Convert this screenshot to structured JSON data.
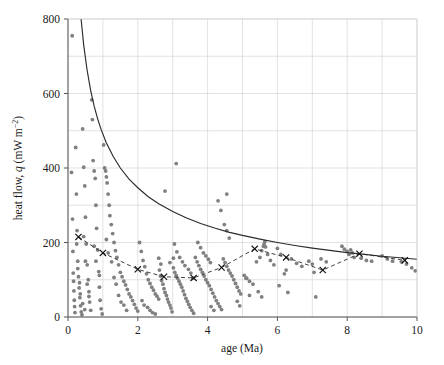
{
  "chart_data": {
    "type": "scatter",
    "title": "",
    "xlabel": "age (Ma)",
    "ylabel_main": "heat flow, ",
    "ylabel_italic": "q",
    "ylabel_units": " (mW m",
    "ylabel_exp": "−2",
    "ylabel_close": ")",
    "ylabel_full": "heat flow, q (mW m−2)",
    "xlim": [
      0,
      10
    ],
    "ylim": [
      0,
      800
    ],
    "xticks": [
      0,
      2,
      4,
      6,
      8,
      10
    ],
    "xtick_labels": [
      "0",
      "2",
      "4",
      "6",
      "8",
      "10"
    ],
    "yticks": [
      0,
      200,
      400,
      600,
      800
    ],
    "ytick_labels": [
      "0",
      "200",
      "400",
      "600",
      "800"
    ],
    "grid": true,
    "grid_x_step": 1,
    "grid_y_step": 100,
    "grid_color": "#cfcfcf",
    "point_color": "#808080",
    "curve_color": "#2b2b2b",
    "dashed_color": "#2b2b2b",
    "marker_color": "#111111",
    "legend": [],
    "series": [
      {
        "name": "heat flow observations",
        "marker": "circle",
        "color": "#808080",
        "points": [
          [
            0.12,
            755
          ],
          [
            0.1,
            388
          ],
          [
            0.13,
            263
          ],
          [
            0.14,
            176
          ],
          [
            0.15,
            118
          ],
          [
            0.16,
            96
          ],
          [
            0.17,
            70
          ],
          [
            0.18,
            45
          ],
          [
            0.19,
            28
          ],
          [
            0.2,
            12
          ],
          [
            0.22,
            455
          ],
          [
            0.24,
            330
          ],
          [
            0.26,
            232
          ],
          [
            0.28,
            150
          ],
          [
            0.3,
            108
          ],
          [
            0.32,
            78
          ],
          [
            0.34,
            52
          ],
          [
            0.36,
            30
          ],
          [
            0.38,
            14
          ],
          [
            0.4,
            6
          ],
          [
            0.42,
            505
          ],
          [
            0.45,
            402
          ],
          [
            0.48,
            352
          ],
          [
            0.5,
            268
          ],
          [
            0.52,
            196
          ],
          [
            0.55,
            140
          ],
          [
            0.58,
            100
          ],
          [
            0.6,
            68
          ],
          [
            0.62,
            40
          ],
          [
            0.65,
            18
          ],
          [
            0.68,
            583
          ],
          [
            0.7,
            530
          ],
          [
            0.72,
            420
          ],
          [
            0.75,
            392
          ],
          [
            0.78,
            372
          ],
          [
            0.8,
            300
          ],
          [
            0.82,
            238
          ],
          [
            0.85,
            180
          ],
          [
            0.88,
            122
          ],
          [
            0.9,
            80
          ],
          [
            0.92,
            45
          ],
          [
            0.95,
            22
          ],
          [
            0.98,
            8
          ],
          [
            1.02,
            462
          ],
          [
            1.05,
            400
          ],
          [
            1.08,
            392
          ],
          [
            1.1,
            376
          ],
          [
            1.12,
            360
          ],
          [
            1.15,
            330
          ],
          [
            1.18,
            300
          ],
          [
            1.2,
            272
          ],
          [
            1.24,
            248
          ],
          [
            1.28,
            224
          ],
          [
            1.32,
            200
          ],
          [
            1.36,
            178
          ],
          [
            1.4,
            160
          ],
          [
            1.45,
            140
          ],
          [
            1.5,
            120
          ],
          [
            1.55,
            108
          ],
          [
            1.6,
            96
          ],
          [
            1.65,
            86
          ],
          [
            1.7,
            74
          ],
          [
            1.75,
            62
          ],
          [
            1.8,
            54
          ],
          [
            1.85,
            44
          ],
          [
            1.9,
            34
          ],
          [
            1.95,
            24
          ],
          [
            2.0,
            16
          ],
          [
            0.45,
            216
          ],
          [
            0.5,
            150
          ],
          [
            0.55,
            88
          ],
          [
            0.6,
            55
          ],
          [
            0.75,
            190
          ],
          [
            0.8,
            150
          ],
          [
            0.9,
            112
          ],
          [
            1.1,
            208
          ],
          [
            1.15,
            172
          ],
          [
            1.25,
            148
          ],
          [
            2.05,
            200
          ],
          [
            2.1,
            176
          ],
          [
            2.15,
            152
          ],
          [
            2.2,
            135
          ],
          [
            2.25,
            116
          ],
          [
            2.3,
            100
          ],
          [
            2.35,
            90
          ],
          [
            2.4,
            80
          ],
          [
            2.45,
            72
          ],
          [
            2.5,
            62
          ],
          [
            2.55,
            56
          ],
          [
            2.6,
            48
          ],
          [
            2.28,
            26
          ],
          [
            2.35,
            18
          ],
          [
            2.42,
            12
          ],
          [
            2.5,
            8
          ],
          [
            2.62,
            126
          ],
          [
            2.65,
            110
          ],
          [
            2.68,
            98
          ],
          [
            2.72,
            88
          ],
          [
            2.75,
            76
          ],
          [
            2.78,
            66
          ],
          [
            2.82,
            58
          ],
          [
            2.85,
            48
          ],
          [
            2.88,
            40
          ],
          [
            2.92,
            32
          ],
          [
            2.95,
            24
          ],
          [
            2.98,
            14
          ],
          [
            2.6,
            158
          ],
          [
            2.66,
            142
          ],
          [
            3.02,
            132
          ],
          [
            3.06,
            120
          ],
          [
            3.1,
            112
          ],
          [
            3.14,
            104
          ],
          [
            3.18,
            96
          ],
          [
            3.22,
            88
          ],
          [
            3.26,
            80
          ],
          [
            3.3,
            70
          ],
          [
            3.34,
            60
          ],
          [
            3.38,
            50
          ],
          [
            3.42,
            42
          ],
          [
            3.46,
            34
          ],
          [
            3.5,
            26
          ],
          [
            3.55,
            18
          ],
          [
            3.6,
            10
          ],
          [
            3.05,
            196
          ],
          [
            3.12,
            175
          ],
          [
            3.2,
            160
          ],
          [
            3.28,
            148
          ],
          [
            3.35,
            138
          ],
          [
            3.45,
            128
          ],
          [
            3.65,
            160
          ],
          [
            3.7,
            148
          ],
          [
            3.75,
            138
          ],
          [
            3.8,
            128
          ],
          [
            3.85,
            120
          ],
          [
            3.9,
            110
          ],
          [
            3.95,
            100
          ],
          [
            4.0,
            92
          ],
          [
            4.05,
            84
          ],
          [
            4.1,
            74
          ],
          [
            4.15,
            64
          ],
          [
            4.2,
            54
          ],
          [
            4.25,
            44
          ],
          [
            4.3,
            36
          ],
          [
            4.35,
            28
          ],
          [
            4.4,
            20
          ],
          [
            3.72,
            200
          ],
          [
            3.8,
            186
          ],
          [
            3.88,
            172
          ],
          [
            3.95,
            164
          ],
          [
            4.02,
            155
          ],
          [
            4.08,
            146
          ],
          [
            4.45,
            156
          ],
          [
            4.5,
            146
          ],
          [
            4.55,
            136
          ],
          [
            4.6,
            126
          ],
          [
            4.65,
            118
          ],
          [
            4.7,
            110
          ],
          [
            4.75,
            100
          ],
          [
            4.8,
            90
          ],
          [
            4.85,
            80
          ],
          [
            4.9,
            70
          ],
          [
            4.95,
            62
          ],
          [
            4.48,
            248
          ],
          [
            4.55,
            232
          ],
          [
            4.62,
            212
          ],
          [
            4.3,
            312
          ],
          [
            4.38,
            286
          ],
          [
            5.05,
            112
          ],
          [
            5.12,
            104
          ],
          [
            5.2,
            96
          ],
          [
            5.3,
            88
          ],
          [
            5.4,
            148
          ],
          [
            5.5,
            160
          ],
          [
            5.55,
            178
          ],
          [
            5.6,
            190
          ],
          [
            5.62,
            196
          ],
          [
            5.64,
            202
          ],
          [
            5.66,
            188
          ],
          [
            5.72,
            168
          ],
          [
            5.8,
            152
          ],
          [
            5.9,
            140
          ],
          [
            6.0,
            184
          ],
          [
            6.1,
            168
          ],
          [
            6.2,
            116
          ],
          [
            6.25,
            126
          ],
          [
            6.4,
            156
          ],
          [
            6.55,
            144
          ],
          [
            6.7,
            136
          ],
          [
            6.9,
            150
          ],
          [
            7.0,
            142
          ],
          [
            7.05,
            120
          ],
          [
            7.25,
            156
          ],
          [
            7.4,
            148
          ],
          [
            7.85,
            190
          ],
          [
            7.92,
            182
          ],
          [
            8.0,
            176
          ],
          [
            8.05,
            168
          ],
          [
            8.1,
            180
          ],
          [
            8.15,
            172
          ],
          [
            8.2,
            160
          ],
          [
            8.4,
            158
          ],
          [
            8.55,
            152
          ],
          [
            8.7,
            150
          ],
          [
            9.0,
            164
          ],
          [
            9.15,
            156
          ],
          [
            9.3,
            150
          ],
          [
            9.55,
            148
          ],
          [
            9.7,
            142
          ],
          [
            9.85,
            132
          ],
          [
            2.78,
            338
          ],
          [
            3.1,
            412
          ],
          [
            4.55,
            330
          ],
          [
            5.1,
            104
          ],
          [
            5.2,
            58
          ],
          [
            4.1,
            28
          ],
          [
            4.18,
            18
          ],
          [
            0.35,
            62
          ],
          [
            0.42,
            36
          ],
          [
            0.48,
            20
          ],
          [
            1.45,
            58
          ],
          [
            1.52,
            40
          ],
          [
            2.92,
            146
          ],
          [
            3.02,
            158
          ],
          [
            3.52,
            118
          ],
          [
            3.58,
            104
          ],
          [
            6.05,
            84
          ],
          [
            6.3,
            66
          ],
          [
            4.85,
            42
          ],
          [
            4.92,
            30
          ],
          [
            0.25,
            196
          ],
          [
            0.28,
            130
          ],
          [
            0.33,
            92
          ],
          [
            1.32,
            106
          ],
          [
            1.38,
            88
          ],
          [
            1.6,
            32
          ],
          [
            1.68,
            18
          ],
          [
            2.12,
            44
          ],
          [
            2.18,
            32
          ],
          [
            5.45,
            68
          ],
          [
            5.55,
            54
          ],
          [
            7.1,
            54
          ],
          [
            9.95,
            124
          ]
        ]
      },
      {
        "name": "binned mean (dashed with crosses)",
        "marker": "x",
        "linestyle": "dashed",
        "color": "#2b2b2b",
        "points": [
          [
            0.3,
            215
          ],
          [
            1.0,
            172
          ],
          [
            2.0,
            128
          ],
          [
            2.75,
            108
          ],
          [
            3.6,
            105
          ],
          [
            4.4,
            133
          ],
          [
            5.35,
            183
          ],
          [
            6.25,
            160
          ],
          [
            7.3,
            126
          ],
          [
            8.35,
            170
          ],
          [
            9.65,
            152
          ]
        ]
      },
      {
        "name": "theoretical cooling curve",
        "marker": "none",
        "linestyle": "solid",
        "color": "#2b2b2b",
        "function": "q = 490 / sqrt(age)",
        "coefficient": 490,
        "points": [
          [
            0.375,
            800
          ],
          [
            0.45,
            730
          ],
          [
            0.55,
            661
          ],
          [
            0.65,
            608
          ],
          [
            0.75,
            566
          ],
          [
            0.85,
            532
          ],
          [
            0.95,
            503
          ],
          [
            1.1,
            467
          ],
          [
            1.3,
            430
          ],
          [
            1.5,
            400
          ],
          [
            1.75,
            370
          ],
          [
            2.0,
            347
          ],
          [
            2.3,
            323
          ],
          [
            2.6,
            304
          ],
          [
            3.0,
            283
          ],
          [
            3.4,
            266
          ],
          [
            3.8,
            251
          ],
          [
            4.2,
            239
          ],
          [
            4.6,
            228
          ],
          [
            5.0,
            219
          ],
          [
            5.5,
            209
          ],
          [
            6.0,
            200
          ],
          [
            6.5,
            192
          ],
          [
            7.0,
            185
          ],
          [
            7.5,
            179
          ],
          [
            8.0,
            173
          ],
          [
            8.5,
            168
          ],
          [
            9.0,
            163
          ],
          [
            9.5,
            159
          ],
          [
            10.0,
            155
          ]
        ]
      }
    ]
  },
  "figure": {
    "background": "#ffffff",
    "plot_left": 68,
    "plot_top": 19,
    "plot_right": 417,
    "plot_bottom": 317
  }
}
